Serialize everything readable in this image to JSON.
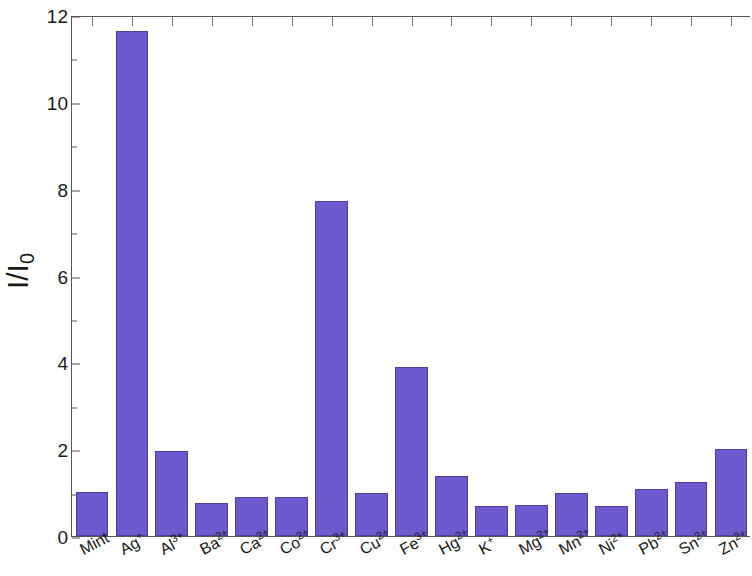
{
  "chart_data": {
    "type": "bar",
    "title": "",
    "subtitle": "",
    "xlabel": "",
    "ylabel": "I/I",
    "ylabel_subscript": "0",
    "ylim": [
      0,
      12
    ],
    "ytick_labels": [
      "0",
      "2",
      "4",
      "6",
      "8",
      "10",
      "12"
    ],
    "ytick_values": [
      0,
      2,
      4,
      6,
      8,
      10,
      12
    ],
    "ytick_minor_values": [
      1,
      3,
      5,
      7,
      9,
      11
    ],
    "grid": false,
    "legend": null,
    "bar_color": "#6a5acd",
    "bar_edge_color": "#4b3f9e",
    "axis_color": "#555555",
    "categories": [
      "Mint",
      "Ag+",
      "Al3+",
      "Ba2+",
      "Ca2+",
      "Co2+",
      "Cr3+",
      "Cu2+",
      "Fe3+",
      "Hg2+",
      "K+",
      "Mg2+",
      "Mn2+",
      "Ni2+",
      "Pb2+",
      "Sn2+",
      "Zn2+"
    ],
    "category_labels": [
      {
        "base": "Mint",
        "charge": ""
      },
      {
        "base": "Ag",
        "charge": "+"
      },
      {
        "base": "Al",
        "charge": "3+"
      },
      {
        "base": "Ba",
        "charge": "2+"
      },
      {
        "base": "Ca",
        "charge": "2+"
      },
      {
        "base": "Co",
        "charge": "2+"
      },
      {
        "base": "Cr",
        "charge": "3+"
      },
      {
        "base": "Cu",
        "charge": "2+"
      },
      {
        "base": "Fe",
        "charge": "3+"
      },
      {
        "base": "Hg",
        "charge": "2+"
      },
      {
        "base": "K",
        "charge": "+"
      },
      {
        "base": "Mg",
        "charge": "2+"
      },
      {
        "base": "Mn",
        "charge": "2+"
      },
      {
        "base": "Ni",
        "charge": "2+"
      },
      {
        "base": "Pb",
        "charge": "2+"
      },
      {
        "base": "Sn",
        "charge": "2+"
      },
      {
        "base": "Zn",
        "charge": "2+"
      }
    ],
    "values": [
      1.02,
      11.63,
      1.96,
      0.76,
      0.89,
      0.9,
      7.72,
      0.98,
      3.89,
      1.38,
      0.69,
      0.71,
      0.98,
      0.69,
      1.08,
      1.25,
      2.01
    ]
  }
}
